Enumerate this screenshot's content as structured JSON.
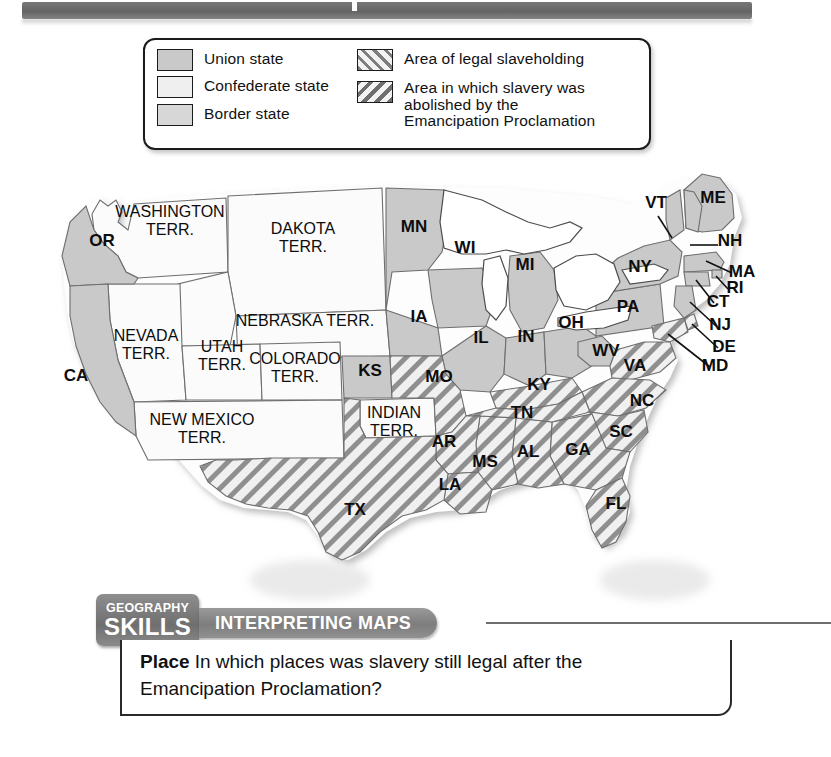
{
  "legend": {
    "items": [
      {
        "id": "union-state",
        "label": "Union state",
        "swatch": "solid-medium-gray",
        "color": "#c9c9c9"
      },
      {
        "id": "confederate-state",
        "label": "Confederate state",
        "swatch": "solid-light-gray",
        "color": "#efefef"
      },
      {
        "id": "border-state",
        "label": "Border state",
        "swatch": "solid-gray",
        "color": "#d7d7d7"
      },
      {
        "id": "legal-slaveholding",
        "label": "Area of legal slaveholding",
        "swatch": "forward-diagonal-hatch",
        "color": "#7e7e7e"
      },
      {
        "id": "abolished-by-emancipation",
        "label": "Area in which slavery was abolished by the Emancipation Proclamation",
        "label_lines": [
          "Area in which slavery was",
          "abolished by the",
          "Emancipation Proclamation"
        ],
        "swatch": "backward-diagonal-hatch",
        "color": "#6e6e6e"
      }
    ]
  },
  "map": {
    "title": "United States during the Civil War",
    "states": [
      {
        "code": "OR",
        "name": "Oregon",
        "category": "union",
        "x": 72,
        "y": 86
      },
      {
        "code": "CA",
        "name": "California",
        "category": "union",
        "x": 46,
        "y": 221
      },
      {
        "code": "MN",
        "name": "Minnesota",
        "category": "union",
        "x": 384,
        "y": 72
      },
      {
        "code": "WI",
        "name": "Wisconsin",
        "category": "union",
        "x": 435,
        "y": 93
      },
      {
        "code": "MI",
        "name": "Michigan",
        "category": "union",
        "x": 495,
        "y": 110
      },
      {
        "code": "IA",
        "name": "Iowa",
        "category": "union",
        "x": 389,
        "y": 162
      },
      {
        "code": "IL",
        "name": "Illinois",
        "category": "union",
        "x": 451,
        "y": 183
      },
      {
        "code": "IN",
        "name": "Indiana",
        "category": "union",
        "x": 496,
        "y": 182
      },
      {
        "code": "OH",
        "name": "Ohio",
        "category": "union",
        "x": 541,
        "y": 168
      },
      {
        "code": "KS",
        "name": "Kansas",
        "category": "union",
        "x": 340,
        "y": 216
      },
      {
        "code": "PA",
        "name": "Pennsylvania",
        "category": "union",
        "x": 598,
        "y": 152
      },
      {
        "code": "NY",
        "name": "New York",
        "category": "union",
        "x": 610,
        "y": 112
      },
      {
        "code": "VT",
        "name": "Vermont",
        "category": "union",
        "x": 626,
        "y": 48
      },
      {
        "code": "ME",
        "name": "Maine",
        "category": "union",
        "x": 683,
        "y": 43
      },
      {
        "code": "NH",
        "name": "New Hampshire",
        "category": "union",
        "x": 700,
        "y": 86
      },
      {
        "code": "MA",
        "name": "Massachusetts",
        "category": "union",
        "x": 712,
        "y": 117
      },
      {
        "code": "RI",
        "name": "Rhode Island",
        "category": "union",
        "x": 705,
        "y": 133
      },
      {
        "code": "CT",
        "name": "Connecticut",
        "category": "union",
        "x": 688,
        "y": 147
      },
      {
        "code": "NJ",
        "name": "New Jersey",
        "category": "union",
        "x": 690,
        "y": 170
      },
      {
        "code": "WV",
        "name": "West Virginia",
        "category": "union",
        "x": 576,
        "y": 196
      },
      {
        "code": "MO",
        "name": "Missouri",
        "category": "border",
        "x": 409,
        "y": 222
      },
      {
        "code": "KY",
        "name": "Kentucky",
        "category": "border",
        "x": 509,
        "y": 230
      },
      {
        "code": "DE",
        "name": "Delaware",
        "category": "border",
        "x": 694,
        "y": 192
      },
      {
        "code": "MD",
        "name": "Maryland",
        "category": "border",
        "x": 685,
        "y": 211
      },
      {
        "code": "VA",
        "name": "Virginia",
        "category": "confederate",
        "x": 605,
        "y": 211
      },
      {
        "code": "NC",
        "name": "North Carolina",
        "category": "confederate",
        "x": 612,
        "y": 246
      },
      {
        "code": "SC",
        "name": "South Carolina",
        "category": "confederate",
        "x": 591,
        "y": 277
      },
      {
        "code": "GA",
        "name": "Georgia",
        "category": "confederate",
        "x": 548,
        "y": 295
      },
      {
        "code": "FL",
        "name": "Florida",
        "category": "confederate",
        "x": 586,
        "y": 349
      },
      {
        "code": "AL",
        "name": "Alabama",
        "category": "confederate",
        "x": 498,
        "y": 297
      },
      {
        "code": "MS",
        "name": "Mississippi",
        "category": "confederate",
        "x": 455,
        "y": 307
      },
      {
        "code": "TN",
        "name": "Tennessee",
        "category": "confederate",
        "x": 492,
        "y": 258
      },
      {
        "code": "AR",
        "name": "Arkansas",
        "category": "confederate",
        "x": 414,
        "y": 287
      },
      {
        "code": "LA",
        "name": "Louisiana",
        "category": "confederate",
        "x": 420,
        "y": 330
      },
      {
        "code": "TX",
        "name": "Texas",
        "category": "confederate",
        "x": 325,
        "y": 355
      }
    ],
    "territories": [
      {
        "name": "Washington Terr.",
        "lines": [
          "WASHINGTON",
          "TERR."
        ],
        "x": 140,
        "y": 57
      },
      {
        "name": "Dakota Terr.",
        "lines": [
          "DAKOTA",
          "TERR."
        ],
        "x": 273,
        "y": 74
      },
      {
        "name": "Nebraska Terr.",
        "lines": [
          "NEBRASKA TERR."
        ],
        "x": 275,
        "y": 166
      },
      {
        "name": "Nevada Terr.",
        "lines": [
          "NEVADA",
          "TERR."
        ],
        "x": 116,
        "y": 181
      },
      {
        "name": "Utah Terr.",
        "lines": [
          "UTAH",
          "TERR."
        ],
        "x": 192,
        "y": 192
      },
      {
        "name": "Colorado Terr.",
        "lines": [
          "COLORADO",
          "TERR."
        ],
        "x": 265,
        "y": 204
      },
      {
        "name": "New Mexico Terr.",
        "lines": [
          "NEW MEXICO",
          "TERR."
        ],
        "x": 172,
        "y": 265
      },
      {
        "name": "Indian Terr.",
        "lines": [
          "INDIAN",
          "TERR."
        ],
        "x": 364,
        "y": 258
      }
    ]
  },
  "skills_banner": {
    "badge_line1": "GEOGRAPHY",
    "badge_line2": "SKILLS",
    "pill_label": "INTERPRETING MAPS"
  },
  "caption": {
    "lead": "Place",
    "question": "In which places was slavery still legal after the Emancipation Proclamation?"
  },
  "colors": {
    "union": "#c9c9c9",
    "confederate": "#efefef",
    "border": "#d7d7d7",
    "territory": "#fbfbfb",
    "water": "#ffffff",
    "outline": "#5a5a5a",
    "banner_gray": "#7d7d7d"
  }
}
